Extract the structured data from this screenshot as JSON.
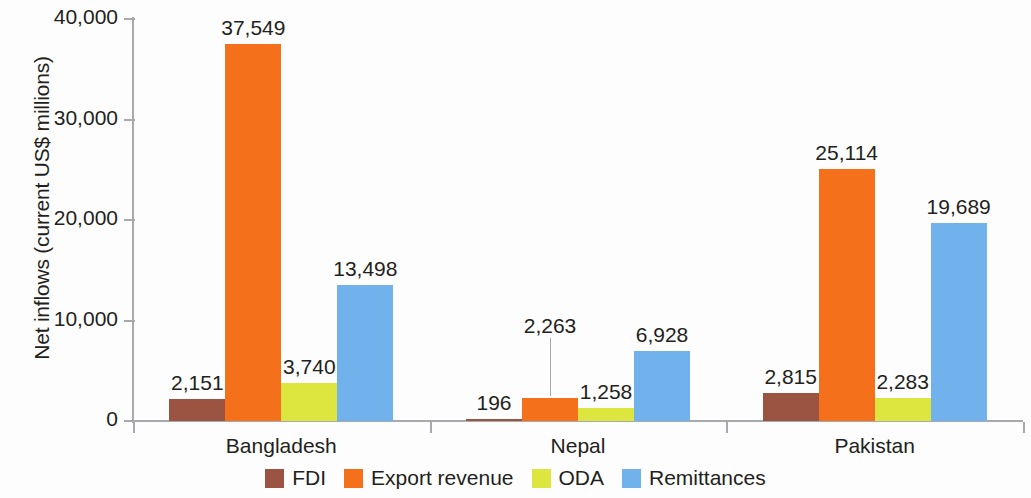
{
  "chart_data": {
    "type": "bar",
    "title": "",
    "subtitle": "",
    "xlabel": "",
    "ylabel": "Net inflows (current US$ millions)",
    "categories": [
      "Bangladesh",
      "Nepal",
      "Pakistan"
    ],
    "series": [
      {
        "name": "FDI",
        "color": "#9c5442",
        "values": [
          2151,
          196,
          2815
        ],
        "labels": [
          "2,151",
          "196",
          "2,815"
        ]
      },
      {
        "name": "Export revenue",
        "color": "#f4701b",
        "values": [
          37549,
          2263,
          25114
        ],
        "labels": [
          "37,549",
          "2,263",
          "25,114"
        ]
      },
      {
        "name": "ODA",
        "color": "#dde63f",
        "values": [
          3740,
          1258,
          2283
        ],
        "labels": [
          "3,740",
          "1,258",
          "2,283"
        ]
      },
      {
        "name": "Remittances",
        "color": "#71b2ec",
        "values": [
          13498,
          6928,
          19689
        ],
        "labels": [
          "13,498",
          "6,928",
          "19,689"
        ]
      }
    ],
    "ylim": [
      0,
      40000
    ],
    "yticks": [
      0,
      10000,
      20000,
      30000,
      40000
    ],
    "ytick_labels": [
      "0",
      "10,000",
      "20,000",
      "30,000",
      "40,000"
    ],
    "grid": false,
    "legend_position": "bottom",
    "value_labels_shown": true
  },
  "axis": {
    "y_title": "Net inflows (current US$ millions)",
    "tick_labels": [
      "40,000",
      "30,000",
      "20,000",
      "10,000",
      "0"
    ]
  },
  "legend": {
    "items": [
      {
        "label": "FDI",
        "color": "#9c5442"
      },
      {
        "label": "Export revenue",
        "color": "#f4701b"
      },
      {
        "label": "ODA",
        "color": "#dde63f"
      },
      {
        "label": "Remittances",
        "color": "#71b2ec"
      }
    ]
  },
  "categories": [
    {
      "label": "Bangladesh"
    },
    {
      "label": "Nepal"
    },
    {
      "label": "Pakistan"
    }
  ]
}
